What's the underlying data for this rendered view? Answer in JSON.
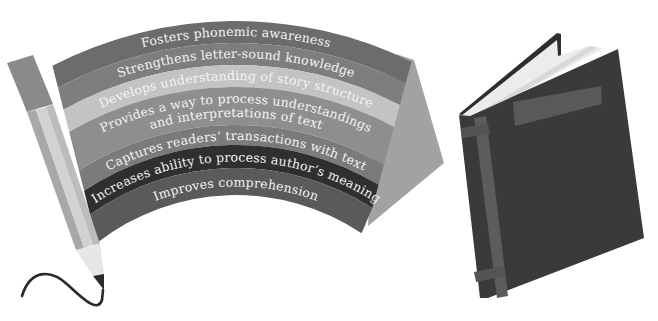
{
  "diagram": {
    "type": "illustration",
    "banner": {
      "bands": [
        {
          "label": "Fosters phonemic awareness",
          "color": "#6c6c6c",
          "lines": [
            "Fosters phonemic awareness"
          ]
        },
        {
          "label": "Strengthens letter-sound knowledge",
          "color": "#7e7e7e",
          "lines": [
            "Strengthens letter-sound knowledge"
          ]
        },
        {
          "label": "Develops understanding of story structure",
          "color": "#c3c3c3",
          "lines": [
            "Develops understanding of story structure"
          ]
        },
        {
          "label": "Provides a way to process understandings and interpretations of text",
          "color": "#8e8e8e",
          "lines": [
            "Provides a way to process understandings",
            "and interpretations of text"
          ]
        },
        {
          "label": "Captures readers' transactions with text",
          "color": "#7b7b7b",
          "lines": [
            "Captures readers’ transactions with text"
          ]
        },
        {
          "label": "Increases ability to process author's meaning",
          "color": "#2f2f2f",
          "lines": [
            "Increases ability to process author’s meaning"
          ]
        },
        {
          "label": "Improves comprehension",
          "color": "#5a5a5a",
          "lines": [
            "Improves comprehension"
          ]
        }
      ],
      "fold_color": "#a2a2a2"
    },
    "pencil": {
      "eraser_color": "#8a8a8a",
      "body_colors": [
        "#bcbcbc",
        "#d2d2d2",
        "#a8a8a8"
      ],
      "wood_color": "#e6e6e6",
      "tip_color": "#2a2a2a",
      "line_color": "#2a2a2a"
    },
    "book": {
      "cover_color": "#3a3a3a",
      "spine_stripe_color": "#5c5c5c",
      "label_color": "#595959",
      "pages_color": "#ececec"
    }
  }
}
